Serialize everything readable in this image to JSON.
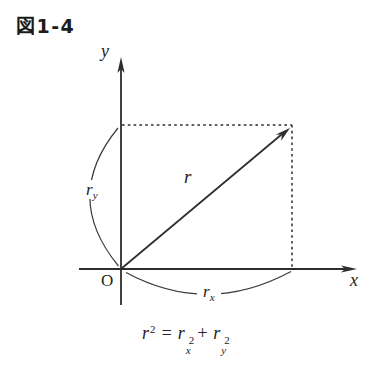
{
  "title": "図1-4",
  "diagram": {
    "labels": {
      "y_axis": "y",
      "x_axis": "x",
      "origin": "O",
      "vector": "r",
      "ry_base": "r",
      "ry_sub": "y",
      "rx_base": "r",
      "rx_sub": "x"
    },
    "formula": {
      "lhs_base": "r",
      "lhs_sup": "2",
      "equals": "=",
      "t1_base": "r",
      "t1_sub": "x",
      "t1_sup": "2",
      "plus": "+",
      "t2_base": "r",
      "t2_sub": "y",
      "t2_sup": "2"
    },
    "colors": {
      "ink": "#2d2d2d",
      "background": "#ffffff"
    }
  }
}
